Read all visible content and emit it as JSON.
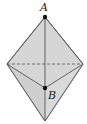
{
  "diagram": {
    "type": "bipyramid",
    "colors": {
      "fill": "#d4d4d4",
      "stroke": "#444444",
      "point": "#111111",
      "background": "#ffffff"
    },
    "points": {
      "A": {
        "label": "A",
        "x": 45,
        "y": 17
      },
      "B": {
        "label": "B",
        "x": 45,
        "y": 88
      }
    }
  }
}
